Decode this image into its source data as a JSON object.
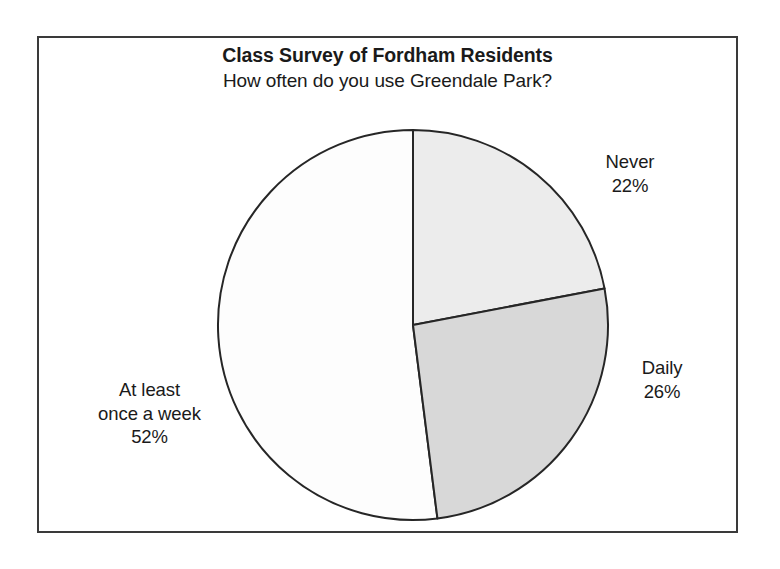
{
  "chart_data": {
    "type": "pie",
    "title": "Class Survey of Fordham Residents",
    "subtitle": "How often do you use Greendale Park?",
    "categories": [
      "Never",
      "Daily",
      "At least once a week"
    ],
    "values": [
      22,
      26,
      52
    ],
    "value_unit": "%",
    "start_angle_deg": 0,
    "direction": "clockwise",
    "legend": "none",
    "grid": false,
    "slices": [
      {
        "name": "Never",
        "label_line1": "Never",
        "label_line2": "22%",
        "value": 22,
        "value_text": "22%",
        "color": "#ececec",
        "start_deg": 0,
        "end_deg": 79.2
      },
      {
        "name": "Daily",
        "label_line1": "Daily",
        "label_line2": "26%",
        "value": 26,
        "value_text": "26%",
        "color": "#d8d8d8",
        "start_deg": 79.2,
        "end_deg": 172.8
      },
      {
        "name": "At least once a week",
        "label_line1": "At least",
        "label_line2": "once a week",
        "label_line3": "52%",
        "value": 52,
        "value_text": "52%",
        "color": "#fdfdfd",
        "start_deg": 172.8,
        "end_deg": 360
      }
    ]
  },
  "figure": {
    "title": "Class Survey of Fordham Residents",
    "subtitle": "How often do you use Greendale Park?",
    "border_color": "#3a3a3a",
    "outline_color": "#262626",
    "background": "#ffffff"
  },
  "labels": {
    "never": {
      "line1": "Never",
      "line2": "22%"
    },
    "daily": {
      "line1": "Daily",
      "line2": "26%"
    },
    "week": {
      "line1": "At least",
      "line2": "once a week",
      "line3": "52%"
    }
  }
}
